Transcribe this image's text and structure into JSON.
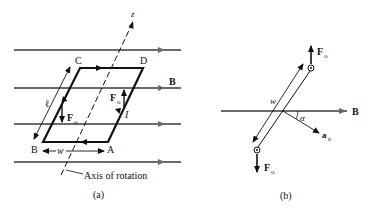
{
  "figure_a": {
    "caption": "(a)",
    "axis_label": "z",
    "field_label": "B",
    "axis_of_rotation_label": "Axis of rotation",
    "corners": {
      "A": "A",
      "B": "B",
      "C": "C",
      "D": "D"
    },
    "length_label": "ℓ",
    "width_label": "w",
    "current_label": "I",
    "force_label_left": "F",
    "force_label_right": "F",
    "force_subscript": "o"
  },
  "figure_b": {
    "caption": "(b)",
    "field_label": "B",
    "width_label": "w",
    "angle_label": "α",
    "normal_label": "a",
    "normal_subscript": "n",
    "force_label_top": "F",
    "force_label_bottom": "F",
    "force_subscript": "o"
  },
  "colors": {
    "field_line": "#6b6b6b",
    "coil": "#111111",
    "text": "#111111"
  }
}
